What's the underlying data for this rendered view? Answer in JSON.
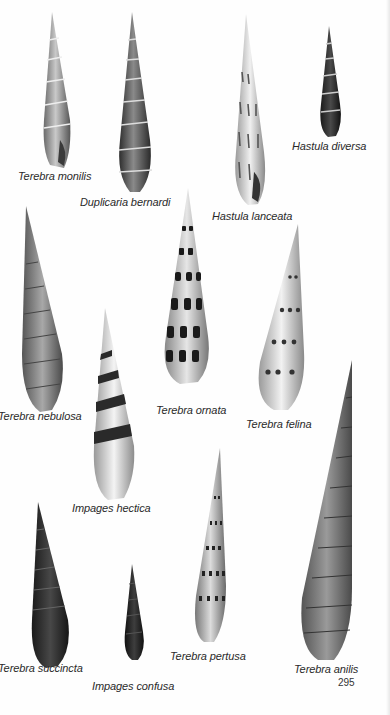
{
  "page": {
    "number": "295",
    "background": "#fefefe"
  },
  "shells": [
    {
      "id": "terebra-monilis",
      "label": "Terebra monilis"
    },
    {
      "id": "duplicaria-bernardi",
      "label": "Duplicaria bernardi"
    },
    {
      "id": "hastula-lanceata",
      "label": "Hastula lanceata"
    },
    {
      "id": "hastula-diversa",
      "label": "Hastula diversa"
    },
    {
      "id": "terebra-nebulosa",
      "label": "Terebra nebulosa"
    },
    {
      "id": "terebra-ornata",
      "label": "Terebra ornata"
    },
    {
      "id": "terebra-felina",
      "label": "Terebra felina"
    },
    {
      "id": "impages-hectica",
      "label": "Impages hectica"
    },
    {
      "id": "terebra-succincta",
      "label": "Terebra succincta"
    },
    {
      "id": "impages-confusa",
      "label": "Impages confusa"
    },
    {
      "id": "terebra-pertusa",
      "label": "Terebra pertusa"
    },
    {
      "id": "terebra-anilis",
      "label": "Terebra anilis"
    }
  ]
}
